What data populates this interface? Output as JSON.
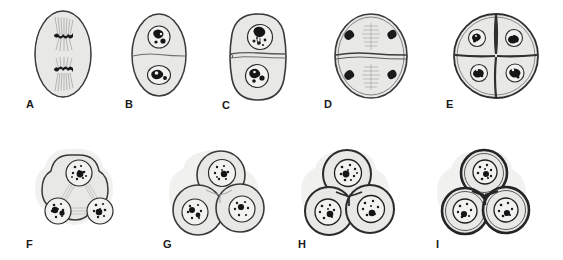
{
  "figure": {
    "type": "scientific-illustration",
    "background_color": "#ffffff",
    "ink_color": "#2b2b2b",
    "cytoplasm_fill": "#e8e8e6",
    "halo_fill": "#f1f1ef",
    "nucleus_fill": "#f2f2f0",
    "chromatin_color": "#1a1a1a",
    "rows": 2,
    "columns_top": 5,
    "columns_bottom": 4
  },
  "panels": [
    {
      "id": "A",
      "label": "A",
      "label_x": 26,
      "label_y": 99,
      "x": 30,
      "y": 8,
      "width": 66,
      "height": 92,
      "cell_shape": "oval",
      "cells": 1,
      "nuclei": 0,
      "stage": "telophase-spindles",
      "has_spindle": true,
      "has_cell_plate": false,
      "has_halo": false,
      "description": "Elongated oval cell with two opposed spindle apparatus and dark chromosome masses at the metaphase plates"
    },
    {
      "id": "B",
      "label": "B",
      "label_x": 127,
      "label_y": 99,
      "x": 128,
      "y": 12,
      "width": 62,
      "height": 86,
      "cell_shape": "oval",
      "cells": 2,
      "nuclei": 2,
      "stage": "thin-cell-plate",
      "has_spindle": false,
      "has_cell_plate": true,
      "has_halo": false,
      "description": "Oval cell divided by a faint thin cell plate into two daughter cells each with a reformed nucleus"
    },
    {
      "id": "C",
      "label": "C",
      "label_x": 222,
      "label_y": 99,
      "x": 224,
      "y": 12,
      "width": 66,
      "height": 88,
      "cell_shape": "rounded-oval",
      "cells": 2,
      "nuclei": 2,
      "stage": "thickening-cell-plate",
      "has_spindle": false,
      "has_cell_plate": true,
      "has_halo": false,
      "description": "Rounder cell with a thickened double-lined dividing wall, two nuclei with prominent nucleoli"
    },
    {
      "id": "D",
      "label": "D",
      "label_x": 324,
      "label_y": 99,
      "x": 332,
      "y": 12,
      "width": 76,
      "height": 86,
      "cell_shape": "round",
      "cells": 2,
      "nuclei": 0,
      "stage": "second-division-spindles",
      "has_spindle": true,
      "has_cell_plate": true,
      "has_halo": false,
      "description": "Two daughter cells separated by a wall, each containing a central spindle with chromatin masses at both poles"
    },
    {
      "id": "E",
      "label": "E",
      "label_x": 446,
      "label_y": 99,
      "x": 452,
      "y": 10,
      "width": 86,
      "height": 90,
      "cell_shape": "round",
      "cells": 4,
      "nuclei": 4,
      "stage": "four-celled-quadrant",
      "has_spindle": false,
      "has_cell_plate": true,
      "has_halo": false,
      "description": "Round cell divided into four quadrant daughter cells by crossed walls, each with a nucleus"
    },
    {
      "id": "F",
      "label": "F",
      "label_x": 26,
      "label_y": 241,
      "x": 28,
      "y": 146,
      "width": 100,
      "height": 92,
      "cell_shape": "trilobed",
      "cells": 1,
      "nuclei": 3,
      "stage": "trilobed-three-nuclei-spindles",
      "has_spindle": true,
      "has_cell_plate": false,
      "has_halo": true,
      "description": "Trilobed cell with gelatinous halo containing three speckled nuclei joined by faint spindle fiber bundles"
    },
    {
      "id": "G",
      "label": "G",
      "label_x": 163,
      "label_y": 241,
      "x": 166,
      "y": 148,
      "width": 98,
      "height": 90,
      "cell_shape": "three-lobed-cleaving",
      "cells": 3,
      "nuclei": 3,
      "stage": "cleavage-furrows-forming",
      "has_spindle": false,
      "has_cell_plate": true,
      "has_halo": true,
      "description": "Three rounded daughter cells separating within a common halo, faint furrow lines between them"
    },
    {
      "id": "H",
      "label": "H",
      "label_x": 298,
      "label_y": 241,
      "x": 300,
      "y": 148,
      "width": 96,
      "height": 90,
      "cell_shape": "three-cells",
      "cells": 3,
      "nuclei": 3,
      "stage": "walls-complete",
      "has_spindle": false,
      "has_cell_plate": true,
      "has_halo": true,
      "description": "Three daughter cells with complete distinct dark walls within a common gelatinous sheath"
    },
    {
      "id": "I",
      "label": "I",
      "label_x": 436,
      "label_y": 241,
      "x": 436,
      "y": 148,
      "width": 96,
      "height": 90,
      "cell_shape": "three-cells",
      "cells": 3,
      "nuclei": 3,
      "stage": "walls-thickened",
      "has_spindle": false,
      "has_cell_plate": true,
      "has_halo": true,
      "description": "Three fully separated daughter cells with heavily thickened double walls and condensed nuclei"
    }
  ]
}
